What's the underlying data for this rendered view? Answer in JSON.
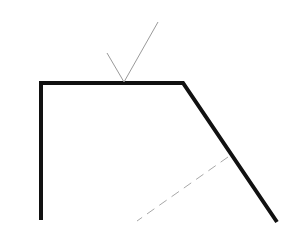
{
  "diagram": {
    "type": "reflection-geometry",
    "colors": {
      "background": "#ffffff",
      "surface": "#111111",
      "ray": "#9a9a9a",
      "dashed": "#a8a8a8"
    },
    "surface_path": [
      [
        41,
        220
      ],
      [
        41,
        83
      ],
      [
        183,
        83
      ],
      [
        277,
        222
      ]
    ],
    "incident_ray": [
      [
        107,
        53
      ],
      [
        124,
        82
      ]
    ],
    "reflected_ray": [
      [
        124,
        82
      ],
      [
        158,
        22
      ]
    ],
    "dashed_line": [
      [
        228,
        157
      ],
      [
        137,
        221
      ]
    ]
  }
}
